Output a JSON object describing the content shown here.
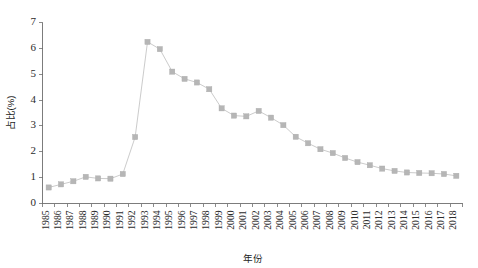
{
  "chart_data": {
    "type": "line",
    "title": "",
    "subtitle": "",
    "xlabel": "年份",
    "ylabel": "占比(%)",
    "xlim": [
      1985,
      2018
    ],
    "ylim": [
      0,
      7
    ],
    "yticks": [
      0,
      1,
      2,
      3,
      4,
      5,
      6,
      7
    ],
    "ytick_labels": [
      "0",
      "1",
      "2",
      "3",
      "4",
      "5",
      "6",
      "7"
    ],
    "grid": false,
    "legend": null,
    "marker": "square",
    "marker_color": "#b6b6b6",
    "line_color": "#c2c2c2",
    "categories": [
      "1985",
      "1986",
      "1987",
      "1988",
      "1989",
      "1990",
      "1991",
      "1992",
      "1993",
      "1994",
      "1995",
      "1996",
      "1997",
      "1998",
      "1999",
      "2000",
      "2001",
      "2002",
      "2003",
      "2004",
      "2005",
      "2006",
      "2007",
      "2008",
      "2009",
      "2010",
      "2011",
      "2012",
      "2013",
      "2014",
      "2015",
      "2016",
      "2017",
      "2018"
    ],
    "x": [
      1985,
      1986,
      1987,
      1988,
      1989,
      1990,
      1991,
      1992,
      1993,
      1994,
      1995,
      1996,
      1997,
      1998,
      1999,
      2000,
      2001,
      2002,
      2003,
      2004,
      2005,
      2006,
      2007,
      2008,
      2009,
      2010,
      2011,
      2012,
      2013,
      2014,
      2015,
      2016,
      2017,
      2018
    ],
    "values": [
      0.62,
      0.74,
      0.86,
      1.03,
      0.97,
      0.96,
      1.14,
      2.57,
      6.25,
      5.97,
      5.1,
      4.82,
      4.68,
      4.42,
      3.68,
      3.4,
      3.37,
      3.58,
      3.32,
      3.03,
      2.58,
      2.33,
      2.1,
      1.95,
      1.76,
      1.6,
      1.48,
      1.35,
      1.26,
      1.2,
      1.18,
      1.17,
      1.14,
      1.07
    ],
    "series": [
      {
        "name": "占比(%)",
        "values": [
          0.62,
          0.74,
          0.86,
          1.03,
          0.97,
          0.96,
          1.14,
          2.57,
          6.25,
          5.97,
          5.1,
          4.82,
          4.68,
          4.42,
          3.68,
          3.4,
          3.37,
          3.58,
          3.32,
          3.03,
          2.58,
          2.33,
          2.1,
          1.95,
          1.76,
          1.6,
          1.48,
          1.35,
          1.26,
          1.2,
          1.18,
          1.17,
          1.14,
          1.07
        ]
      }
    ],
    "annotations": []
  }
}
